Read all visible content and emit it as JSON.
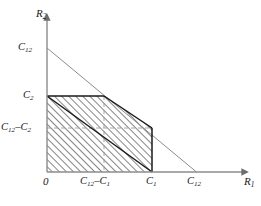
{
  "figure": {
    "type": "math-diagram",
    "background": "#ffffff",
    "axes": {
      "x": {
        "name": "R1",
        "name_base": "R",
        "name_sub": "1",
        "origin_px": 47,
        "end_px": 246,
        "arrow": true
      },
      "y": {
        "name": "R2",
        "name_base": "R",
        "name_sub": "2",
        "origin_px": 172,
        "end_px": 16,
        "arrow": true
      }
    },
    "x_ticks": [
      {
        "label_base": "0",
        "label_sub": "",
        "x_px": 47
      },
      {
        "label_base": "C",
        "label_sub": "12",
        "op": "–",
        "label_base2": "C",
        "label_sub2": "1",
        "x_px": 104
      },
      {
        "label_base": "C",
        "label_sub": "1",
        "x_px": 152
      },
      {
        "label_base": "C",
        "label_sub": "12",
        "x_px": 196
      }
    ],
    "y_ticks": [
      {
        "label_base": "C",
        "label_sub": "12",
        "y_px": 48
      },
      {
        "label_base": "C",
        "label_sub": "2",
        "y_px": 96
      },
      {
        "label_base": "C",
        "label_sub": "12",
        "op": "–",
        "label_base2": "C",
        "label_sub2": "2",
        "y_px": 128
      }
    ],
    "labels": {
      "y_axis_name": "R₂",
      "x_axis_name": "R₁",
      "origin": "0",
      "x_tick_1": "C₁₂–C₁",
      "x_tick_2": "C₁",
      "x_tick_3": "C₁₂",
      "y_tick_1": "C₁₂",
      "y_tick_2": "C₂",
      "y_tick_3": "C₁₂–C₂"
    },
    "colors": {
      "axis": "#8c8c8c",
      "outer_line": "#8c8c8c",
      "region_border": "#1a1a1a",
      "hatch": "#2b2b2b",
      "dashed_grid": "#9a9a9a",
      "text": "#1a1a1a"
    },
    "outer_constraint_line": {
      "description": "R1 + R2 = C12",
      "from": {
        "x_px": 47,
        "y_px": 48
      },
      "to": {
        "x_px": 196,
        "y_px": 172
      },
      "style": "thin-gray"
    },
    "inner_diagonal_line": {
      "description": "lower bold diagonal of feasible region",
      "from": {
        "x_px": 47,
        "y_px": 96
      },
      "to": {
        "x_px": 152,
        "y_px": 172
      },
      "style": "bold-black"
    },
    "region": {
      "description": "hatched feasible region",
      "hatch_angle_deg": 45,
      "hatch_direction": "forward-slash",
      "vertices_px": [
        {
          "x": 47,
          "y": 172
        },
        {
          "x": 47,
          "y": 96
        },
        {
          "x": 104,
          "y": 96
        },
        {
          "x": 152,
          "y": 128
        },
        {
          "x": 152,
          "y": 172
        }
      ]
    },
    "dashed_gridlines": [
      {
        "orientation": "horizontal",
        "y_px": 128,
        "from_x_px": 47,
        "to_x_px": 152
      },
      {
        "orientation": "vertical",
        "x_px": 104,
        "from_y_px": 96,
        "to_y_px": 172
      }
    ]
  }
}
